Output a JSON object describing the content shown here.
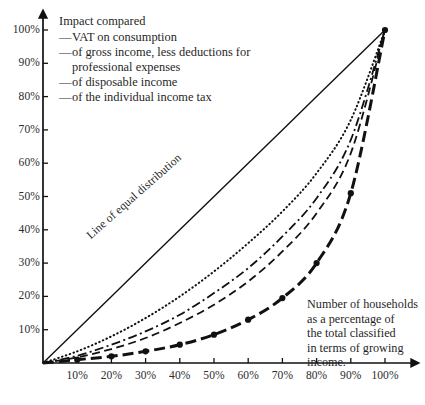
{
  "chart_data": {
    "type": "line",
    "title": "",
    "subtitle": "",
    "xlabel": "",
    "ylabel": "",
    "xlim": [
      0,
      100
    ],
    "ylim": [
      0,
      100
    ],
    "grid": false,
    "legend_position": "top-left",
    "x_ticks": [
      "10%",
      "20%",
      "30%",
      "40%",
      "50%",
      "60%",
      "70%",
      "80%",
      "90%",
      "100%"
    ],
    "y_ticks": [
      "10%",
      "20%",
      "30%",
      "40%",
      "50%",
      "60%",
      "70%",
      "80%",
      "90%",
      "100%"
    ],
    "x_tick_values": [
      10,
      20,
      30,
      40,
      50,
      60,
      70,
      80,
      90,
      100
    ],
    "y_tick_values": [
      10,
      20,
      30,
      40,
      50,
      60,
      70,
      80,
      90,
      100
    ],
    "x": [
      0,
      10,
      20,
      30,
      40,
      50,
      60,
      70,
      80,
      90,
      100
    ],
    "annotations": [
      {
        "name": "line-of-equal-distribution",
        "text": "Line of equal distribution",
        "rotated": true,
        "angle_deg": -41.5
      },
      {
        "name": "x-axis-note",
        "text": "Number of households as a percentage of the total classified in terms of growing income."
      }
    ],
    "series": [
      {
        "name": "Line of equal distribution",
        "style": "solid",
        "markers": false,
        "width": 1.4,
        "color": "#111111",
        "values": [
          0,
          10,
          20,
          30,
          40,
          50,
          60,
          70,
          80,
          90,
          100
        ]
      },
      {
        "name": "VAT on consumption",
        "style": "dotted",
        "markers": false,
        "width": 2.0,
        "color": "#111111",
        "values": [
          0,
          3.5,
          8,
          13.5,
          20,
          27.5,
          36,
          45.5,
          57,
          73,
          100
        ]
      },
      {
        "name": "of gross income, less deductions for professional expenses",
        "style": "dashdot",
        "markers": false,
        "width": 1.8,
        "color": "#111111",
        "values": [
          0,
          2.2,
          5.5,
          9.5,
          14.5,
          21,
          28.5,
          38,
          49.5,
          67,
          100
        ]
      },
      {
        "name": "of disposable income",
        "style": "dashed",
        "markers": false,
        "width": 1.8,
        "color": "#111111",
        "values": [
          0,
          1.7,
          4.2,
          7.5,
          12,
          17.5,
          24.5,
          33.5,
          45,
          63,
          100
        ]
      },
      {
        "name": "of the individual income tax",
        "style": "dashed-thick",
        "markers": true,
        "width": 3.0,
        "color": "#111111",
        "values": [
          0,
          1.0,
          2.0,
          3.5,
          5.5,
          8.5,
          13,
          19.5,
          30,
          51,
          100
        ]
      }
    ]
  },
  "legend": {
    "title": "Impact compared",
    "dash": "—",
    "items": [
      {
        "label": "VAT on consumption"
      },
      {
        "label": "of gross income, less deductions for"
      },
      {
        "label": "of disposable income"
      },
      {
        "label": "of the individual income tax"
      }
    ],
    "continuation": "professional expenses"
  },
  "diagonal_label": {
    "text": "Line of equal distribution"
  },
  "annotation": {
    "line1": "Number of households",
    "line2": "as a percentage of",
    "line3": "the total classified",
    "line4": "in terms of growing",
    "line5": "income."
  },
  "axes": {
    "x_labels": [
      "10%",
      "20%",
      "30%",
      "40%",
      "50%",
      "60%",
      "70%",
      "80%",
      "90%",
      "100%"
    ],
    "y_labels": [
      "100%",
      "90%",
      "80%",
      "70%",
      "60%",
      "50%",
      "40%",
      "30%",
      "20%",
      "10%"
    ]
  },
  "colors": {
    "ink": "#111111",
    "background": "#ffffff",
    "text": "#1f1f1f"
  }
}
